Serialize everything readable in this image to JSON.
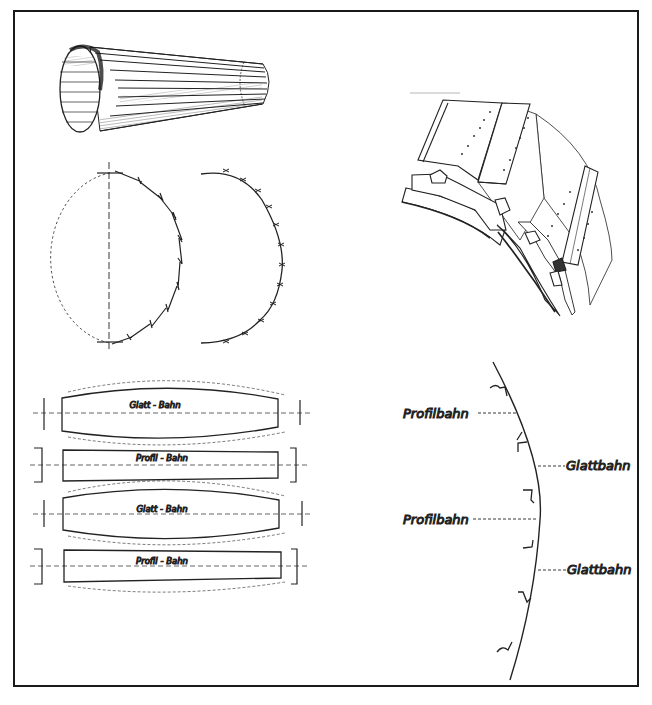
{
  "figure": {
    "frame": {
      "border_color": "#1a1a1a",
      "background": "#ffffff"
    },
    "panels": {
      "cone_drum": {
        "description": "perspective view of tapered drum made of longitudinal strips"
      },
      "cross_sections": {
        "left": {
          "description": "semicircle of overlapping stepped segments with dashed full outline and vertical dashed axis"
        },
        "right": {
          "description": "semicircle of segments joined at star-marked seams"
        }
      },
      "segment_assembly": {
        "description": "isometric view of curved ring with profiled and smooth strip segments and rivet dots"
      },
      "strip_layout": {
        "strips": [
          {
            "label": "Glatt - Bahn",
            "shape": "bulged"
          },
          {
            "label": "Profil - Bahn",
            "shape": "straight"
          },
          {
            "label": "Glatt - Bahn",
            "shape": "bulged"
          },
          {
            "label": "Profil - Bahn",
            "shape": "straight"
          }
        ]
      },
      "profile_section": {
        "labels": [
          {
            "text": "Profilbahn",
            "side": "left"
          },
          {
            "text": "Glattbahn",
            "side": "right"
          },
          {
            "text": "Profilbahn",
            "side": "left"
          },
          {
            "text": "Glattbahn",
            "side": "right"
          }
        ]
      }
    }
  }
}
